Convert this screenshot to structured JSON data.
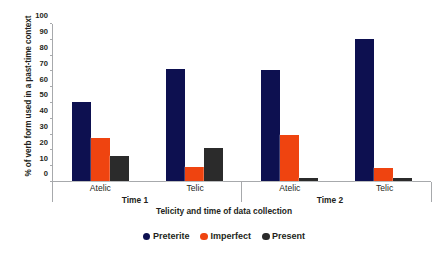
{
  "chart_data": {
    "type": "bar",
    "title": "",
    "xlabel": "Telicity and time of data collection",
    "ylabel": "% of verb form used in a past-time context",
    "categories": [
      "Atelic",
      "Telic",
      "Atelic",
      "Telic"
    ],
    "group_labels": [
      "Time 1",
      "Time 2"
    ],
    "series": [
      {
        "name": "Preterite",
        "color": "#0d1050",
        "values": [
          50,
          71,
          70,
          90
        ]
      },
      {
        "name": "Imperfect",
        "color": "#ef4410",
        "values": [
          27,
          9,
          29,
          8
        ]
      },
      {
        "name": "Present",
        "color": "#2b2b2b",
        "values": [
          16,
          21,
          2,
          2
        ]
      }
    ],
    "ylim": [
      0,
      100
    ],
    "yticks": [
      0,
      10,
      20,
      30,
      40,
      50,
      60,
      70,
      80,
      90,
      100
    ],
    "grid": false,
    "legend_position": "bottom"
  }
}
